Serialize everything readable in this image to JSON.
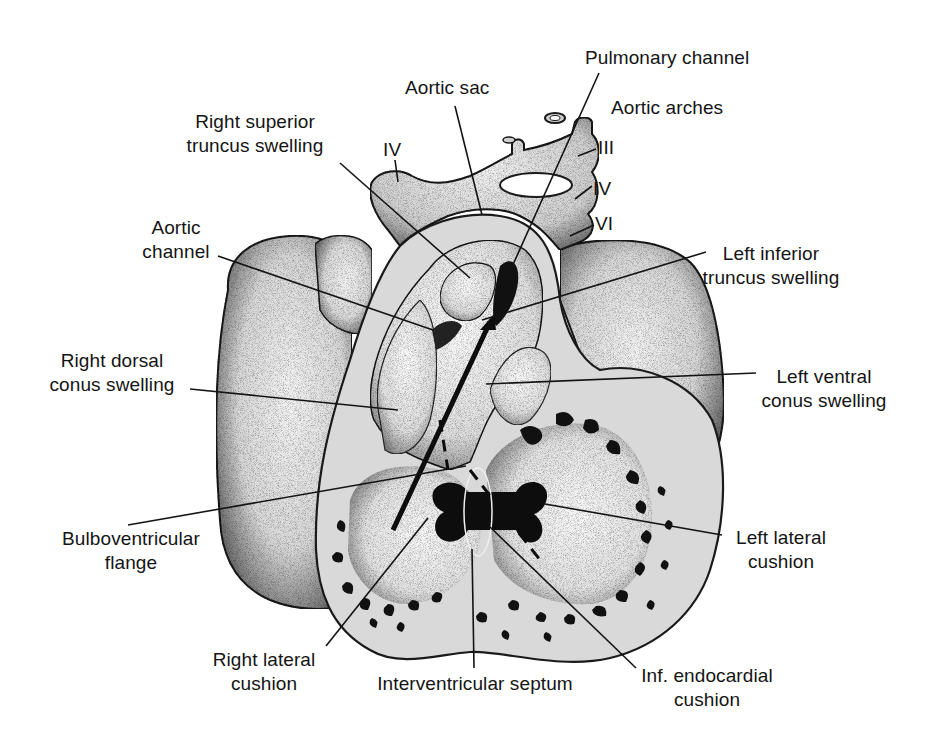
{
  "figure": {
    "colors": {
      "background": "#ffffff",
      "ink": "#141414",
      "tissue_light": "#ececec",
      "tissue_mid": "#cfcfcf",
      "tissue_dark": "#8a8a8a",
      "cut_surface": "#d9d9d9",
      "trabeculae": "#111111"
    }
  },
  "labels": {
    "pulmonary_channel": {
      "line1": "Pulmonary channel"
    },
    "aortic_sac": {
      "line1": "Aortic sac"
    },
    "aortic_arches": {
      "line1": "Aortic arches"
    },
    "arch_iii": {
      "line1": "III"
    },
    "arch_iv_right": {
      "line1": "IV"
    },
    "arch_vi": {
      "line1": "VI"
    },
    "arch_iv_left": {
      "line1": "IV"
    },
    "right_superior_truncus": {
      "line1": "Right superior",
      "line2": "truncus swelling"
    },
    "aortic_channel": {
      "line1": "Aortic",
      "line2": "channel"
    },
    "left_inferior_truncus": {
      "line1": "Left inferior",
      "line2": "truncus swelling"
    },
    "right_dorsal_conus": {
      "line1": "Right dorsal",
      "line2": "conus swelling"
    },
    "left_ventral_conus": {
      "line1": "Left ventral",
      "line2": "conus swelling"
    },
    "bulboventricular_flange": {
      "line1": "Bulboventricular",
      "line2": "flange"
    },
    "left_lateral_cushion": {
      "line1": "Left lateral",
      "line2": "cushion"
    },
    "right_lateral_cushion": {
      "line1": "Right lateral",
      "line2": "cushion"
    },
    "interventricular_septum": {
      "line1": "Interventricular septum"
    },
    "inf_endocardial_cushion": {
      "line1": "Inf. endocardial",
      "line2": "cushion"
    }
  }
}
